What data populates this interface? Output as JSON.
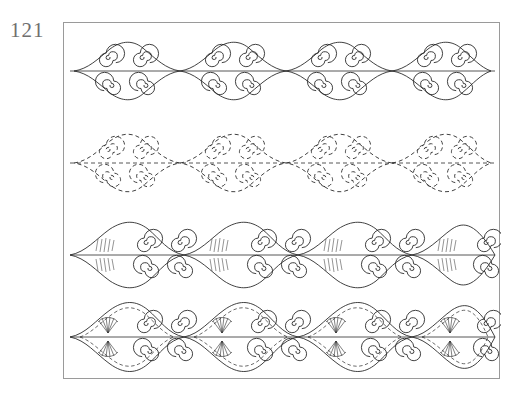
{
  "plate": {
    "number": "121"
  },
  "figure": {
    "title": "",
    "caption": "",
    "frame": {
      "border_color": "#9a9a9a",
      "background": "#ffffff"
    },
    "ink_color": "#2b2b2b",
    "bands": [
      {
        "id": "band-1",
        "label": "spiral-wave-outline-band",
        "line_style": "solid",
        "repeats": 5,
        "description": "continuous wave of pointed lens shapes each enclosing paired double spirals, drawn in solid line"
      },
      {
        "id": "band-2",
        "label": "spiral-wave-dashed-band",
        "line_style": "dashed",
        "repeats": 5,
        "description": "same spiral-and-lens wave rendered entirely in short dashes"
      },
      {
        "id": "band-3",
        "label": "spiral-wave-hatched-band",
        "line_style": "solid-with-hatching",
        "repeats": 5,
        "description": "spiral wave with solid outlines and fine hatched shading filling the lens interiors"
      },
      {
        "id": "band-4",
        "label": "spiral-wave-filled-band",
        "line_style": "solid-with-dashed-fill",
        "repeats": 5,
        "description": "densest version, spiral wave with dashed infill and fan motifs inside each lens"
      }
    ]
  }
}
